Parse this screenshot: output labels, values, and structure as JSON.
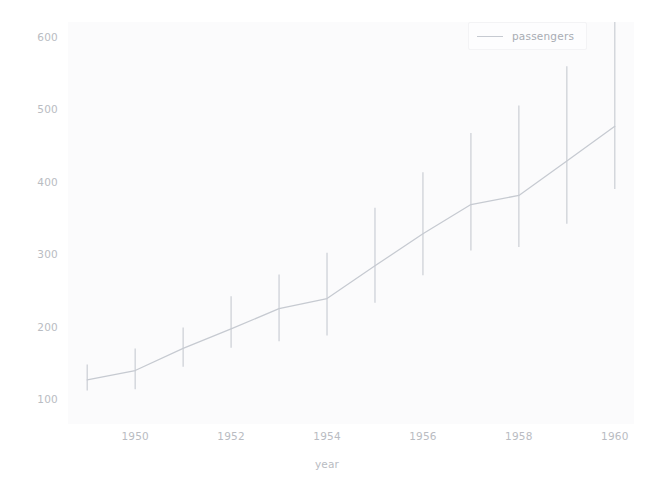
{
  "chart_data": {
    "type": "line",
    "title": "",
    "xlabel": "year",
    "ylabel": "",
    "xlim": [
      1948.6,
      1960.4
    ],
    "ylim": [
      66,
      620
    ],
    "grid": false,
    "legend_position": "upper right",
    "xticks": [
      "1950",
      "1952",
      "1954",
      "1956",
      "1958",
      "1960"
    ],
    "xtick_values": [
      1950,
      1952,
      1954,
      1956,
      1958,
      1960
    ],
    "yticks": [
      "100",
      "200",
      "300",
      "400",
      "500",
      "600"
    ],
    "ytick_values": [
      100,
      200,
      300,
      400,
      500,
      600
    ],
    "x": [
      1949,
      1950,
      1951,
      1952,
      1953,
      1954,
      1955,
      1956,
      1957,
      1958,
      1959,
      1960
    ],
    "series": [
      {
        "name": "passengers",
        "color": "#c6cad1",
        "values": [
          126.7,
          139.7,
          170.2,
          197.0,
          225.0,
          238.9,
          284.0,
          328.2,
          368.4,
          381.0,
          428.3,
          476.2
        ],
        "err_low": [
          112,
          114,
          145,
          171,
          180,
          188,
          233,
          271,
          305,
          310,
          342,
          390
        ],
        "err_high": [
          148,
          170,
          199,
          242,
          272,
          302,
          364,
          413,
          467,
          505,
          559,
          622
        ]
      }
    ],
    "legend": [
      "passengers"
    ]
  },
  "legend": {
    "label": "passengers"
  },
  "axes": {
    "xlabel": "year"
  }
}
